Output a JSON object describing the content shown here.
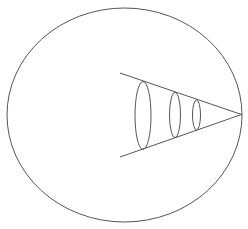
{
  "diagram": {
    "stroke_color": "#555555",
    "background": "#ffffff",
    "outer_ellipse": {
      "cx": 124.5,
      "cy": 115,
      "rx": 117.5,
      "ry": 107
    },
    "apex": {
      "x": 241.5,
      "y": 114.5
    },
    "cone_lines": [
      {
        "x1": 120,
        "y1": 73,
        "x2": 241.5,
        "y2": 114.5
      },
      {
        "x1": 120,
        "y1": 157,
        "x2": 241.5,
        "y2": 114.5
      }
    ],
    "inner_ellipses": [
      {
        "cx": 143,
        "cy": 115.5,
        "rx": 8,
        "ry": 34
      },
      {
        "cx": 175,
        "cy": 115,
        "rx": 5.5,
        "ry": 22.5
      },
      {
        "cx": 196.5,
        "cy": 115,
        "rx": 4,
        "ry": 15
      }
    ]
  }
}
